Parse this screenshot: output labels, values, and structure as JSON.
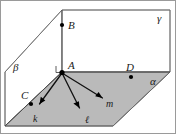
{
  "figure": {
    "planes": [
      {
        "id": "alpha",
        "label": "α",
        "shading": "gray",
        "color": "#b4b4b4",
        "orientation": "horizontal-base"
      },
      {
        "id": "beta",
        "label": "β",
        "shading": "white",
        "color": "#ffffff",
        "orientation": "left-slanted"
      },
      {
        "id": "gamma",
        "label": "γ",
        "shading": "white",
        "color": "#ffffff",
        "orientation": "right-vertical"
      }
    ],
    "points": [
      {
        "id": "A",
        "label": "A",
        "on": "alpha-beta-gamma-vertex"
      },
      {
        "id": "B",
        "label": "B",
        "on": "gamma"
      },
      {
        "id": "C",
        "label": "C",
        "on": "alpha-beta-edge"
      },
      {
        "id": "D",
        "label": "D",
        "on": "alpha-gamma-edge"
      }
    ],
    "rays": [
      {
        "id": "k",
        "label": "k",
        "from": "A",
        "direction": "down-left"
      },
      {
        "id": "l",
        "label": "ℓ",
        "from": "A",
        "direction": "down"
      },
      {
        "id": "m",
        "label": "m",
        "from": "A",
        "direction": "down-right"
      }
    ],
    "marks": [
      {
        "id": "right-angle-at-A",
        "type": "right-angle",
        "at": "A"
      }
    ],
    "colors": {
      "shaded_plane": "#b4b4b4",
      "edge": "#6e6e6e",
      "ray": "#111111",
      "label": "#1a1a1a",
      "background": "#ffffff"
    }
  }
}
